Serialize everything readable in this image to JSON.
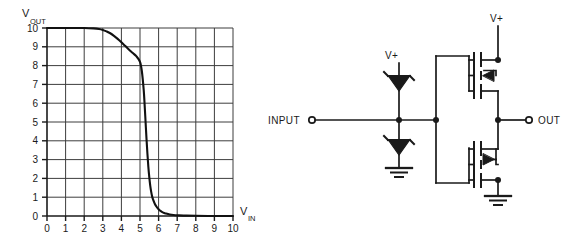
{
  "figure": {
    "title": "",
    "background_color": "#ffffff",
    "ink_color": "#1a1a1a",
    "grid_color": "#3d3d3d"
  },
  "chart_data": {
    "type": "line",
    "title": "",
    "xlabel": "V IN",
    "xlabel_main": "V",
    "xlabel_sub": "IN",
    "ylabel": "V OUT",
    "ylabel_main": "V",
    "ylabel_sub": "OUT",
    "xlim": [
      0,
      10
    ],
    "ylim": [
      0,
      10
    ],
    "grid": true,
    "legend": "none",
    "xticks": [
      0,
      1,
      2,
      3,
      4,
      5,
      6,
      7,
      8,
      9,
      10
    ],
    "xtick_labels": [
      "0",
      "1",
      "2",
      "3",
      "4",
      "5",
      "6",
      "7",
      "8",
      "9",
      "10"
    ],
    "yticks": [
      0,
      1,
      2,
      3,
      4,
      5,
      6,
      7,
      8,
      9,
      10
    ],
    "ytick_labels": [
      "0",
      "1",
      "2",
      "3",
      "4",
      "5",
      "6",
      "7",
      "8",
      "9",
      "10"
    ],
    "series": [
      {
        "name": "transfer-curve",
        "color": "#111111",
        "x": [
          0.0,
          0.5,
          1.0,
          1.5,
          2.0,
          2.5,
          2.8,
          3.0,
          3.2,
          3.4,
          3.6,
          3.8,
          4.0,
          4.2,
          4.4,
          4.6,
          4.8,
          5.0,
          5.1,
          5.2,
          5.25,
          5.3,
          5.35,
          5.4,
          5.45,
          5.5,
          5.55,
          5.6,
          5.65,
          5.7,
          5.8,
          5.9,
          6.0,
          6.1,
          6.25,
          6.4,
          6.6,
          6.8,
          7.0,
          7.5,
          8.0,
          9.0,
          10.0
        ],
        "y": [
          10.0,
          10.0,
          10.0,
          10.0,
          10.0,
          9.98,
          9.95,
          9.9,
          9.82,
          9.72,
          9.58,
          9.42,
          9.24,
          9.05,
          8.86,
          8.68,
          8.5,
          8.2,
          7.7,
          6.7,
          5.9,
          5.0,
          4.1,
          3.3,
          2.6,
          2.05,
          1.62,
          1.3,
          1.05,
          0.88,
          0.64,
          0.48,
          0.36,
          0.27,
          0.18,
          0.13,
          0.08,
          0.05,
          0.04,
          0.02,
          0.01,
          0.0,
          0.0
        ]
      }
    ]
  },
  "circuit": {
    "name": "protected-cmos-inverter",
    "nodes": {
      "input_terminal_label": "INPUT",
      "output_terminal_label": "OUT",
      "supply_label_left": "V+",
      "supply_label_right": "V+"
    },
    "components": [
      {
        "id": "d1",
        "type": "zener-diode",
        "name": "upper-clamp-diode",
        "orientation": "cathode-to-supply"
      },
      {
        "id": "d2",
        "type": "zener-diode",
        "name": "lower-clamp-diode",
        "orientation": "anode-to-ground"
      },
      {
        "id": "box1",
        "type": "logic-block",
        "name": "internal-gate-block",
        "label": ""
      },
      {
        "id": "m1",
        "type": "pmos-transistor",
        "name": "pull-up-pmos"
      },
      {
        "id": "m2",
        "type": "nmos-transistor",
        "name": "pull-down-nmos"
      },
      {
        "id": "gnd1",
        "type": "ground-symbol",
        "name": "input-ground"
      },
      {
        "id": "gnd2",
        "type": "ground-symbol",
        "name": "output-ground"
      }
    ]
  }
}
